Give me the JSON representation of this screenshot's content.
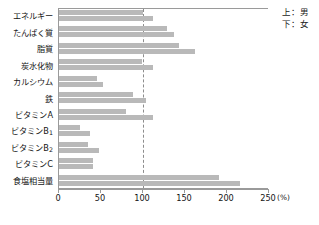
{
  "legend": {
    "male_line": "上：男",
    "female_line": "下：女"
  },
  "axis": {
    "unit": "(%)",
    "ticks": [
      "0",
      "50",
      "100",
      "150",
      "200",
      "250"
    ]
  },
  "chart_data": {
    "type": "bar",
    "orientation": "horizontal",
    "title": "",
    "xlabel": "(%)",
    "ylabel": "",
    "xlim": [
      0,
      250
    ],
    "xticks": [
      0,
      50,
      100,
      150,
      200,
      250
    ],
    "grid": false,
    "reference_line": 100,
    "legend_position": "top-right",
    "legend": [
      "上：男",
      "下：女"
    ],
    "categories": [
      "エネルギー",
      "たんぱく質",
      "脂質",
      "炭水化物",
      "カルシウム",
      "鉄",
      "ビタミンA",
      "ビタミンB1",
      "ビタミンB2",
      "ビタミンC",
      "食塩相当量"
    ],
    "series": [
      {
        "name": "上：男",
        "values": [
          100,
          128,
          143,
          99,
          45,
          88,
          80,
          25,
          35,
          40,
          190
        ]
      },
      {
        "name": "下：女",
        "values": [
          112,
          137,
          162,
          112,
          52,
          104,
          112,
          37,
          48,
          40,
          215
        ]
      }
    ]
  }
}
